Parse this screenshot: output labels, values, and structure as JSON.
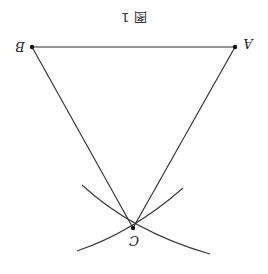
{
  "figure": {
    "title": "图 1",
    "orientation": "rotated-180",
    "colors": {
      "line": "#2b2b2b",
      "point": "#111111",
      "background": "#ffffff"
    },
    "points": {
      "A": {
        "label": "A",
        "x": 235,
        "y": 47
      },
      "B": {
        "label": "B",
        "x": 32,
        "y": 47
      },
      "C": {
        "label": "C",
        "x": 133,
        "y": 228
      }
    },
    "segments": [
      [
        "B",
        "A"
      ],
      [
        "B",
        "C"
      ],
      [
        "A",
        "C"
      ]
    ],
    "arcs": [
      {
        "center": "B",
        "radius": 207,
        "description": "arc through C centered at B"
      },
      {
        "center": "A",
        "radius": 208,
        "description": "arc through C centered at A"
      }
    ]
  }
}
